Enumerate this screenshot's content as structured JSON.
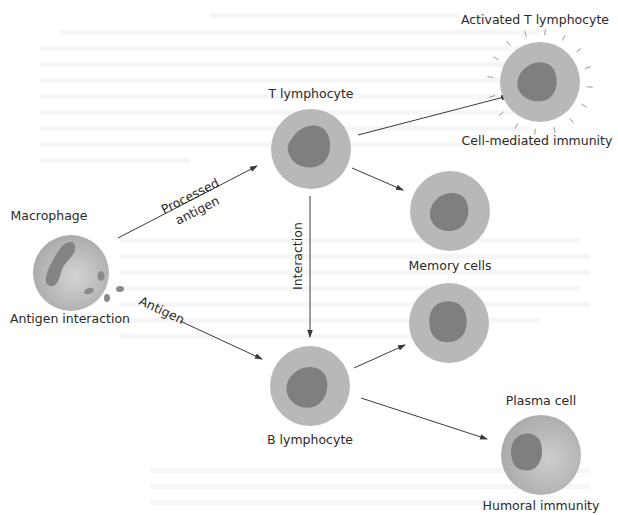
{
  "diagram": {
    "colors": {
      "cytoplasm": "#b8b8b8",
      "cytoplasm_edge": "#a9a9a9",
      "nucleus": "#7f7f7f",
      "arrow": "#3a3a3a",
      "text": "#2a2a2a",
      "background": "#ffffff"
    },
    "cells": {
      "macrophage": {
        "label": "Macrophage",
        "caption": "Antigen interaction"
      },
      "t_lymphocyte": {
        "label": "T lymphocyte"
      },
      "activated_t": {
        "label": "Activated T lymphocyte",
        "caption": "Cell-mediated immunity"
      },
      "memory_t": {
        "caption": "Memory cells"
      },
      "memory_b": {},
      "b_lymphocyte": {
        "caption": "B lymphocyte"
      },
      "plasma": {
        "label": "Plasma cell",
        "caption": "Humoral immunity"
      }
    },
    "arrows": {
      "processed_antigen": {
        "line1": "Processed",
        "line2": "antigen"
      },
      "antigen": {
        "label": "Antigen"
      },
      "interaction": {
        "label": "Interaction"
      }
    }
  }
}
